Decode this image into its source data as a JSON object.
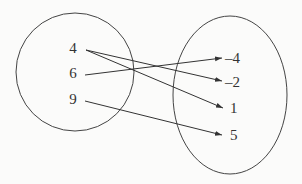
{
  "diagram": {
    "type": "mapping",
    "domain_set": {
      "elements": [
        {
          "label": "4",
          "x": 73,
          "y": 48
        },
        {
          "label": "6",
          "x": 73,
          "y": 73
        },
        {
          "label": "9",
          "x": 73,
          "y": 99
        }
      ]
    },
    "range_set": {
      "elements": [
        {
          "label": "–4",
          "x": 236,
          "y": 59
        },
        {
          "label": "–2",
          "x": 236,
          "y": 83
        },
        {
          "label": "1",
          "x": 236,
          "y": 109
        },
        {
          "label": "5",
          "x": 236,
          "y": 136
        }
      ]
    },
    "mappings": [
      {
        "from": "4",
        "to": "–2"
      },
      {
        "from": "4",
        "to": "1"
      },
      {
        "from": "6",
        "to": "–4"
      },
      {
        "from": "9",
        "to": "5"
      }
    ]
  }
}
